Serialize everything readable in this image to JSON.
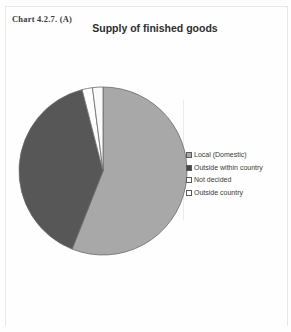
{
  "caption": "Chart 4.2.7. (A)",
  "title": "Supply of finished goods",
  "legend": {
    "items": [
      {
        "label": "Local (Domestic)",
        "swatch": "hatched-gray"
      },
      {
        "label": "Outside within country",
        "swatch": "solid-dark"
      },
      {
        "label": "Not decided",
        "swatch": "white"
      },
      {
        "label": "Outside country",
        "swatch": "white"
      }
    ]
  },
  "colors": {
    "local_domestic": "#a8a8a8",
    "outside_within_country": "#575757",
    "not_decided": "#ffffff",
    "outside_country": "#fafafa",
    "slice_border": "#6b6b6b",
    "text": "#3a3a3a"
  },
  "chart_data": {
    "type": "pie",
    "title": "Supply of finished goods",
    "categories": [
      "Local (Domestic)",
      "Outside within country",
      "Not decided",
      "Outside country"
    ],
    "values": [
      56,
      40,
      2,
      2
    ],
    "unit": "percent",
    "start_angle_deg": 0,
    "direction": "clockwise",
    "legend_position": "right",
    "grid": false,
    "slice_colors": [
      "#a8a8a8",
      "#575757",
      "#ffffff",
      "#fafafa"
    ]
  }
}
